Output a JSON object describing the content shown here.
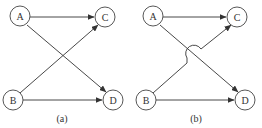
{
  "panels": [
    {
      "caption": "(a)",
      "nodes": {
        "A": "A",
        "B": "B",
        "C": "C",
        "D": "D"
      },
      "edges": [
        "A->C",
        "A->D",
        "B->C",
        "B->D"
      ],
      "crossing": "intersecting lines"
    },
    {
      "caption": "(b)",
      "nodes": {
        "A": "A",
        "B": "B",
        "C": "C",
        "D": "D"
      },
      "edges": [
        "A->C",
        "A->D",
        "B->C",
        "B->D"
      ],
      "crossing": "line jump (B->C hops over A->D)"
    }
  ]
}
